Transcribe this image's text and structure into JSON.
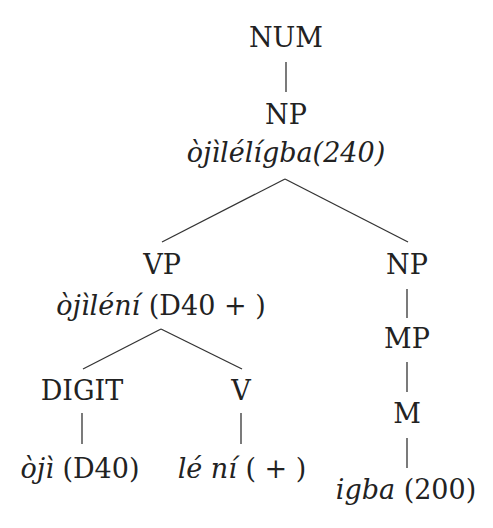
{
  "diagram": {
    "type": "syntax-tree",
    "nodes": {
      "root": {
        "label": "NUM"
      },
      "np_top": {
        "label": "NP",
        "gloss_word": "òjìlélígba(240)"
      },
      "vp": {
        "label": "VP",
        "gloss_word": "òjìléní",
        "gloss_value": "(D40 + )"
      },
      "np_right": {
        "label": "NP"
      },
      "mp": {
        "label": "MP"
      },
      "m": {
        "label": "M",
        "gloss_word": "igba",
        "gloss_value": "(200)"
      },
      "digit": {
        "label": "DIGIT",
        "gloss_word": "òjì",
        "gloss_value": "(D40)"
      },
      "v": {
        "label": "V",
        "gloss_word": "lé ní",
        "gloss_value": "( + )"
      }
    },
    "edges": [
      [
        "NUM",
        "NP"
      ],
      [
        "NP",
        "VP"
      ],
      [
        "NP",
        "NP"
      ],
      [
        "VP",
        "DIGIT"
      ],
      [
        "VP",
        "V"
      ],
      [
        "NP",
        "MP"
      ],
      [
        "MP",
        "M"
      ],
      [
        "DIGIT",
        "òjì (D40)"
      ],
      [
        "V",
        "lé ní ( + )"
      ],
      [
        "M",
        "igba (200)"
      ]
    ]
  }
}
